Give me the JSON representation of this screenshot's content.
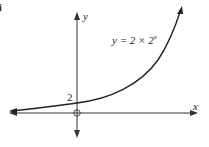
{
  "figure_label": "i",
  "axes": {
    "x_label": "x",
    "y_label": "y",
    "origin_label": "O"
  },
  "curve": {
    "equation_prefix": "y = 2 × 2",
    "equation_exponent": "x",
    "y_intercept_label": "2"
  },
  "colors": {
    "stroke": "#222222",
    "background": "#ffffff"
  }
}
